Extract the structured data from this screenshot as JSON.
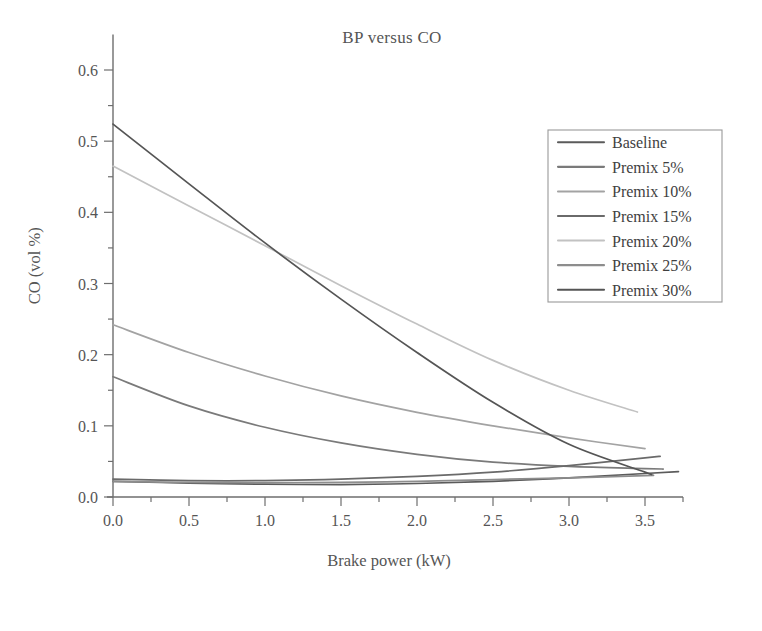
{
  "chart_data": {
    "type": "line",
    "title": "BP versus CO",
    "xlabel": "Brake power (kW)",
    "ylabel": "CO (vol %)",
    "xlim": [
      0.0,
      3.75
    ],
    "ylim": [
      -0.02,
      0.65
    ],
    "grid": false,
    "legend_position": "upper-right",
    "xticks": [
      "0.0",
      "0.5",
      "1.0",
      "1.5",
      "2.0",
      "2.5",
      "3.0",
      "3.5"
    ],
    "xtick_values": [
      0.0,
      0.5,
      1.0,
      1.5,
      2.0,
      2.5,
      3.0,
      3.5
    ],
    "xminor_step": 0.25,
    "yticks": [
      "0.0",
      "0.1",
      "0.2",
      "0.3",
      "0.4",
      "0.5",
      "0.6"
    ],
    "ytick_values": [
      0.0,
      0.1,
      0.2,
      0.3,
      0.4,
      0.5,
      0.6
    ],
    "yminor_step": 0.05,
    "x": [
      0.0,
      0.5,
      1.0,
      1.5,
      2.0,
      2.5,
      3.0,
      3.5
    ],
    "series": [
      {
        "name": "Baseline",
        "color": "#5b5b5b",
        "width": 1.7,
        "values": [
          0.022,
          0.0195,
          0.018,
          0.0175,
          0.019,
          0.022,
          0.027,
          0.033
        ],
        "x_end": 3.72
      },
      {
        "name": "Premix 5%",
        "color": "#7a7a7a",
        "width": 1.7,
        "values": [
          0.169,
          0.128,
          0.098,
          0.076,
          0.06,
          0.049,
          0.043,
          0.04
        ],
        "x_end": 3.62
      },
      {
        "name": "Premix 10%",
        "color": "#a3a3a3",
        "width": 1.7,
        "values": [
          0.242,
          0.203,
          0.17,
          0.142,
          0.119,
          0.1,
          0.083,
          0.068
        ],
        "x_end": 3.5
      },
      {
        "name": "Premix 15%",
        "color": "#6a6a6a",
        "width": 1.7,
        "values": [
          0.025,
          0.023,
          0.023,
          0.025,
          0.029,
          0.035,
          0.044,
          0.055
        ],
        "x_end": 3.6
      },
      {
        "name": "Premix 20%",
        "color": "#c2c2c2",
        "width": 1.7,
        "values": [
          0.465,
          0.409,
          0.353,
          0.297,
          0.243,
          0.192,
          0.15,
          0.116
        ],
        "x_end": 3.45
      },
      {
        "name": "Premix 25%",
        "color": "#8d8d8d",
        "width": 1.7,
        "values": [
          0.022,
          0.0205,
          0.02,
          0.0205,
          0.022,
          0.0245,
          0.027,
          0.03
        ],
        "x_end": 3.55
      },
      {
        "name": "Premix 30%",
        "color": "#555555",
        "width": 1.7,
        "values": [
          0.524,
          0.44,
          0.357,
          0.278,
          0.203,
          0.133,
          0.074,
          0.035
        ],
        "x_end": 3.52
      }
    ]
  },
  "legend": {
    "items": [
      {
        "label": "Baseline"
      },
      {
        "label": "Premix 5%"
      },
      {
        "label": "Premix 10%"
      },
      {
        "label": "Premix 15%"
      },
      {
        "label": "Premix 20%"
      },
      {
        "label": "Premix 25%"
      },
      {
        "label": "Premix 30%"
      }
    ]
  }
}
